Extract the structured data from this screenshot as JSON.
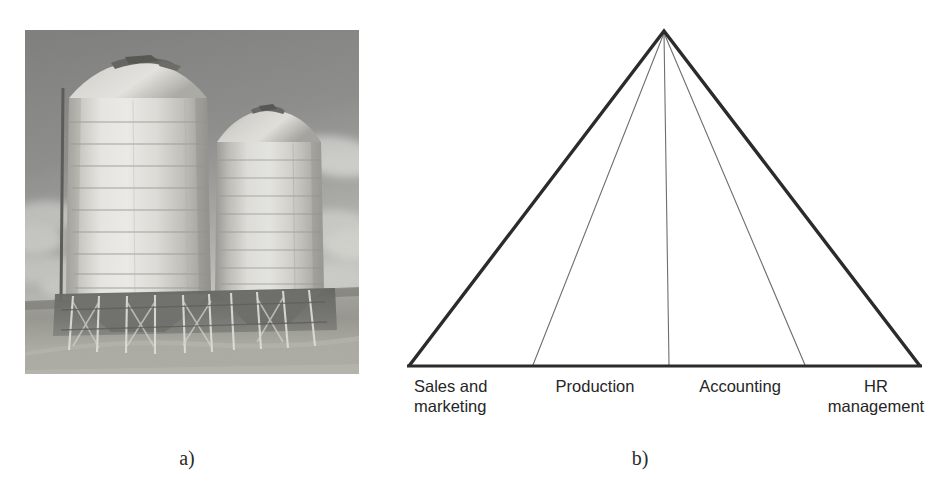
{
  "figure": {
    "background_color": "#ffffff",
    "panels": [
      {
        "id": "a",
        "caption": "a)",
        "type": "photograph",
        "subject": "Two cylindrical metal grain storage silos standing on steel legs in a grassy field under a cloudy sky, rendered in grayscale."
      },
      {
        "id": "b",
        "caption": "b)",
        "type": "diagram",
        "subject": "Triangle (pyramid) divided by internal lines into four vertical functional silos."
      }
    ]
  },
  "photo": {
    "alt": "grain-silos-photograph",
    "palette": {
      "sky_dark": "#6f6f6e",
      "sky_light": "#b9b9b6",
      "cloud": "#d8d8d4",
      "silo_bright": "#efeee9",
      "silo_mid": "#cfcec8",
      "silo_shadow": "#8e8d87",
      "ground": "#9a9a93",
      "ground_dark": "#5a5a55",
      "legs": "#4a4a46",
      "grass": "#a8a8a0"
    },
    "elements": {
      "silo_left": "large-front-silo",
      "silo_right": "rear-silo",
      "support_legs": "steel-support-legs",
      "field": "grass-field",
      "sky": "cloudy-sky"
    }
  },
  "pyramid": {
    "title": "functional-silos-pyramid",
    "geometry": {
      "apex": {
        "x": 284,
        "y": 31
      },
      "base_left": {
        "x": 29,
        "y": 366
      },
      "base_right": {
        "x": 540,
        "y": 366
      },
      "divider_base_x": [
        153,
        289,
        425
      ]
    },
    "style": {
      "outline_color": "#2b2b2b",
      "outline_width": 3.4,
      "divider_color": "#6a6a6a",
      "divider_width": 1.1,
      "base_color": "#2b2b2b",
      "base_width": 3.0
    },
    "segments": [
      {
        "index": 0,
        "label": "Sales and\nmarketing"
      },
      {
        "index": 1,
        "label": "Production"
      },
      {
        "index": 2,
        "label": "Accounting"
      },
      {
        "index": 3,
        "label": "HR\nmanagement"
      }
    ]
  },
  "captions": {
    "a": "a)",
    "b": "b)"
  }
}
